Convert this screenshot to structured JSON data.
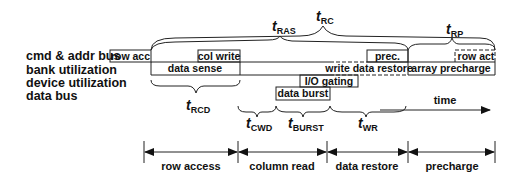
{
  "row_labels": [
    "cmd & addr bus",
    "bank utilization",
    "device utilization",
    "data bus"
  ],
  "boxes": {
    "row_acc": "row acc",
    "col_write": "col write",
    "data_sense": "data sense",
    "prec": "prec.",
    "write_data_restore": "write data restore",
    "array_precharge": "array precharge",
    "row_act": "row act",
    "io_gating": "I/O gating",
    "data_burst": "data burst"
  },
  "timing_params": {
    "tRC": {
      "t": "t",
      "sub": "RC"
    },
    "tRAS": {
      "t": "t",
      "sub": "RAS"
    },
    "tRP": {
      "t": "t",
      "sub": "RP"
    },
    "tRCD": {
      "t": "t",
      "sub": "RCD"
    },
    "tCWD": {
      "t": "t",
      "sub": "CWD"
    },
    "tBURST": {
      "t": "t",
      "sub": "BURST"
    },
    "tWR": {
      "t": "t",
      "sub": "WR"
    }
  },
  "time_label": "time",
  "phases": [
    "row access",
    "column read",
    "data restore",
    "precharge"
  ]
}
